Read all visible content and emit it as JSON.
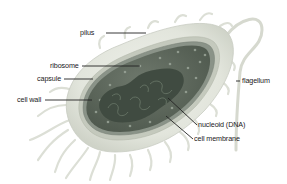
{
  "diagram": {
    "labels": [
      {
        "id": "pilus",
        "text": "pilus",
        "x": 89,
        "y": 30,
        "align": "right"
      },
      {
        "id": "ribosome",
        "text": "ribosome",
        "x": 52,
        "y": 63,
        "align": "right"
      },
      {
        "id": "capsule",
        "text": "capsule",
        "x": 39,
        "y": 76,
        "align": "right"
      },
      {
        "id": "cell_wall",
        "text": "cell wall",
        "x": 20,
        "y": 97,
        "align": "right"
      },
      {
        "id": "flagellum",
        "text": "flagellum",
        "x": 243,
        "y": 78,
        "align": "left"
      },
      {
        "id": "nucleoid",
        "text": "nucleoid (DNA)",
        "x": 198,
        "y": 122,
        "align": "left"
      },
      {
        "id": "cell_membrane",
        "text": "cell membrane",
        "x": 194,
        "y": 136,
        "align": "left"
      }
    ],
    "colors": {
      "background": "#ffffff",
      "capsule": "#e4e6de",
      "cell_wall": "#c9cdc2",
      "cytoplasm": "#5f6a5e",
      "nucleoid": "#3f4a40",
      "leader_line": "#222222",
      "pili": "#dcdfd6"
    }
  }
}
